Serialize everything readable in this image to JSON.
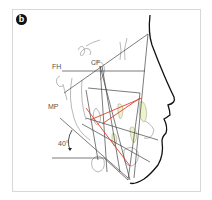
{
  "figure": {
    "panel_label": "b",
    "labels": {
      "fh": "FH",
      "cf": "CF",
      "mp": "MP",
      "angle": "40°"
    },
    "colors": {
      "lines": "#444444",
      "profile": "#111111",
      "red_lines": "#e0402a",
      "teeth_fill": "#eef3c8",
      "border": "#d8d8d8"
    }
  }
}
